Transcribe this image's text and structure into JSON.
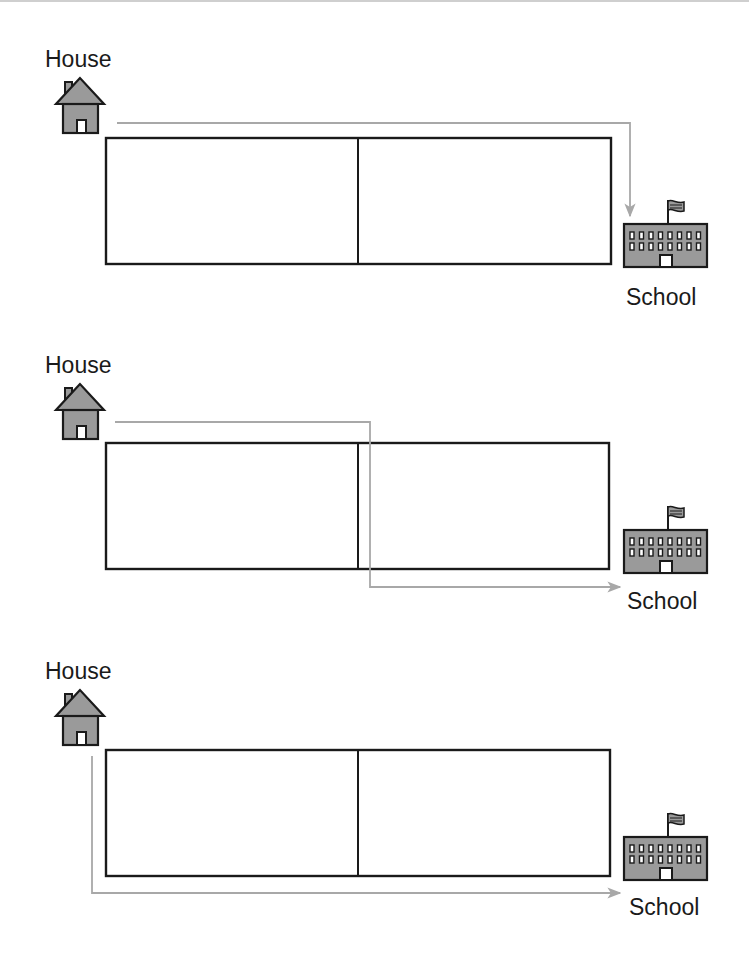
{
  "colors": {
    "outline": "#1a1a1a",
    "icon_fill": "#9a9a9a",
    "path": "#a8a8a8",
    "door": "#ffffff"
  },
  "panels": [
    {
      "house_label": "House",
      "school_label": "School",
      "route": "over-top-then-down-to-school"
    },
    {
      "house_label": "House",
      "school_label": "School",
      "route": "across-then-through-middle-then-right"
    },
    {
      "house_label": "House",
      "school_label": "School",
      "route": "down-left-side-then-along-bottom"
    }
  ]
}
